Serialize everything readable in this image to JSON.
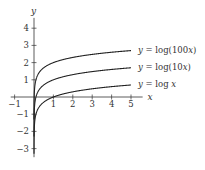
{
  "chart_data": {
    "type": "line",
    "title": "",
    "xlabel": "x",
    "ylabel": "y",
    "xlim": [
      -1.2,
      5.6
    ],
    "ylim": [
      -3.5,
      4.6
    ],
    "x_ticks": [
      -1,
      1,
      2,
      3,
      4,
      5
    ],
    "y_ticks": [
      -3,
      -2,
      -1,
      1,
      2,
      3,
      4
    ],
    "x_tick_labels": [
      "−1",
      "1",
      "2",
      "3",
      "4",
      "5"
    ],
    "y_tick_labels": [
      "−3",
      "−2",
      "−1",
      "1",
      "2",
      "3",
      "4"
    ],
    "grid": false,
    "legend_position": "inline-right",
    "series": [
      {
        "name": "y = log(100x)",
        "function": "log10(100*x)",
        "x_range": [
          0.001,
          5
        ],
        "end_value": 2.699
      },
      {
        "name": "y = log(10x)",
        "function": "log10(10*x)",
        "x_range": [
          0.001,
          5
        ],
        "end_value": 1.699
      },
      {
        "name": "y = log x",
        "function": "log10(x)",
        "x_range": [
          0.001,
          5
        ],
        "end_value": 0.699
      }
    ]
  },
  "labels": {
    "axis_x": "x",
    "axis_y": "y",
    "series_0_prefix": "y = ",
    "series_0_fn": "log(100",
    "series_0_var": "x",
    "series_0_suffix": ")",
    "series_1_prefix": "y = ",
    "series_1_fn": "log(10",
    "series_1_var": "x",
    "series_1_suffix": ")",
    "series_2_prefix": "y = ",
    "series_2_fn": "log ",
    "series_2_var": "x"
  },
  "colors": {
    "axis": "#333333",
    "curve": "#222222"
  }
}
